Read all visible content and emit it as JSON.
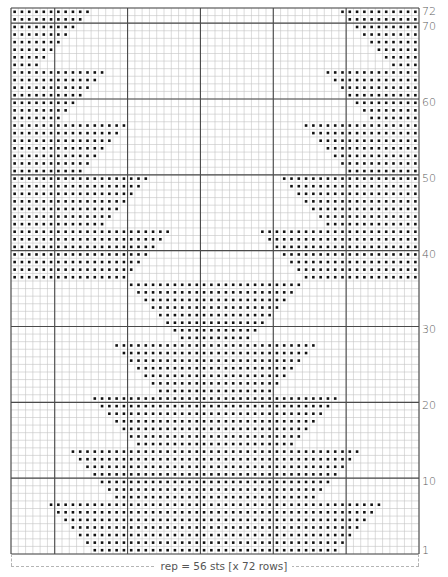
{
  "chart": {
    "stitches": 56,
    "rows": 72,
    "major_every": 10,
    "colors": {
      "fine_grid": "#c4c4c4",
      "major_grid": "#4a4a4a",
      "dot": "#111111",
      "label": "#5a5a5a"
    }
  },
  "row_labels": [
    {
      "row": 72,
      "text": "72"
    },
    {
      "row": 70,
      "text": "70"
    },
    {
      "row": 60,
      "text": "60"
    },
    {
      "row": 50,
      "text": "50"
    },
    {
      "row": 40,
      "text": "40"
    },
    {
      "row": 30,
      "text": "30"
    },
    {
      "row": 20,
      "text": "20"
    },
    {
      "row": 10,
      "text": "10"
    },
    {
      "row": 1,
      "text": "1"
    }
  ],
  "caption": {
    "text": "rep = 56 sts [x 72 rows]"
  },
  "pattern": {
    "edge_rows_description": "Rows 72-37: dots from each outer edge inward (count per side, mirrored).",
    "edge_counts": {
      "72": 11,
      "71": 10,
      "70": 9,
      "69": 8,
      "68": 7,
      "67": 6,
      "66": 5,
      "65": 4,
      "64": 13,
      "63": 12,
      "62": 11,
      "61": 10,
      "60": 9,
      "59": 8,
      "58": 7,
      "57": 16,
      "56": 15,
      "55": 14,
      "54": 13,
      "53": 12,
      "52": 11,
      "51": 10,
      "50": 19,
      "49": 18,
      "48": 17,
      "47": 16,
      "46": 15,
      "45": 14,
      "44": 13,
      "43": 22,
      "42": 21,
      "41": 20,
      "40": 19,
      "39": 18,
      "38": 17,
      "37": 16
    },
    "center_rows_description": "Rows 36-1: centered block starting at column index (from left, 0-based) and mirrored to 55-start.",
    "center_starts": {
      "36": 16,
      "35": 17,
      "34": 18,
      "33": 19,
      "32": 20,
      "31": 21,
      "30": 22,
      "29": 23,
      "28": 14,
      "27": 15,
      "26": 16,
      "25": 17,
      "24": 18,
      "23": 19,
      "22": 20,
      "21": 11,
      "20": 12,
      "19": 13,
      "18": 14,
      "17": 15,
      "16": 16,
      "15": 17,
      "14": 8,
      "13": 9,
      "12": 10,
      "11": 11,
      "10": 12,
      "9": 13,
      "8": 14,
      "7": 5,
      "6": 6,
      "5": 7,
      "4": 8,
      "3": 9,
      "2": 10,
      "1": 11
    }
  }
}
